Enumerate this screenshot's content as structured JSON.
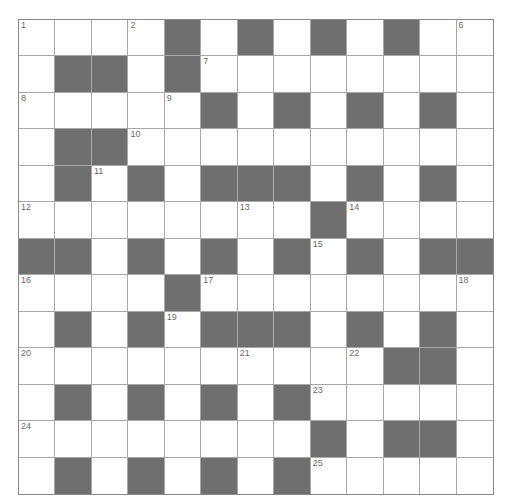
{
  "puzzle": {
    "rows": 13,
    "cols": 13,
    "colors": {
      "block": "#6f6f6f",
      "cell": "#ffffff",
      "grid_line": "#a8a8a8",
      "number": "#6a6a6a"
    },
    "layout": [
      "....#.#.#.#..",
      ".##.#........",
      ".....#.#.#.#.",
      ".##..........",
      ".#.#.###.#.#.",
      "........#....",
      "##.#.#.#.#.##",
      "....#........",
      ".#.#.###.#.#.",
      "..........##.",
      ".#.#.#.#.....",
      "........#.##.",
      ".#.#.#.#....."
    ],
    "numbers": [
      {
        "n": "1",
        "r": 0,
        "c": 0
      },
      {
        "n": "2",
        "r": 0,
        "c": 3
      },
      {
        "n": "3",
        "r": 0,
        "c": 6
      },
      {
        "n": "4",
        "r": 0,
        "c": 8
      },
      {
        "n": "5",
        "r": 0,
        "c": 10
      },
      {
        "n": "6",
        "r": 0,
        "c": 12
      },
      {
        "n": "7",
        "r": 1,
        "c": 5
      },
      {
        "n": "8",
        "r": 2,
        "c": 0
      },
      {
        "n": "9",
        "r": 2,
        "c": 4
      },
      {
        "n": "10",
        "r": 3,
        "c": 3
      },
      {
        "n": "11",
        "r": 4,
        "c": 2
      },
      {
        "n": "12",
        "r": 5,
        "c": 0
      },
      {
        "n": "13",
        "r": 5,
        "c": 6
      },
      {
        "n": "14",
        "r": 5,
        "c": 9
      },
      {
        "n": "15",
        "r": 6,
        "c": 8
      },
      {
        "n": "16",
        "r": 7,
        "c": 0
      },
      {
        "n": "17",
        "r": 7,
        "c": 5
      },
      {
        "n": "18",
        "r": 7,
        "c": 12
      },
      {
        "n": "19",
        "r": 8,
        "c": 4
      },
      {
        "n": "20",
        "r": 9,
        "c": 0
      },
      {
        "n": "21",
        "r": 9,
        "c": 6
      },
      {
        "n": "22",
        "r": 9,
        "c": 9
      },
      {
        "n": "23",
        "r": 10,
        "c": 8
      },
      {
        "n": "24",
        "r": 11,
        "c": 0
      },
      {
        "n": "25",
        "r": 12,
        "c": 8
      }
    ]
  }
}
